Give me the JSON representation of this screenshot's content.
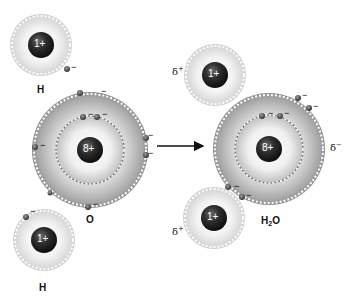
{
  "diagram": {
    "reaction_arrow": "→",
    "reactants": {
      "hydrogen_top": {
        "symbol": "H",
        "nucleus_charge": "1+",
        "electrons": 1
      },
      "oxygen": {
        "symbol": "O",
        "nucleus_charge": "8+",
        "inner_shell_electrons": 2,
        "outer_shell_electrons": 6
      },
      "hydrogen_bottom": {
        "symbol": "H",
        "nucleus_charge": "1+",
        "electrons": 1
      }
    },
    "product": {
      "formula_main": "H",
      "formula_sub": "2",
      "formula_tail": "O",
      "hydrogen_top": {
        "nucleus_charge": "1+",
        "partial_charge": "δ",
        "partial_sign": "+"
      },
      "oxygen": {
        "nucleus_charge": "8+",
        "partial_charge": "δ",
        "partial_sign": "−"
      },
      "hydrogen_bottom": {
        "nucleus_charge": "1+",
        "partial_charge": "δ",
        "partial_sign": "+"
      }
    },
    "electron_sign": "−",
    "colors": {
      "nucleus": "#2a2a2a",
      "shell_light": "#f2f2f2",
      "shell_dark": "#9a9a9a",
      "electron": "#555555",
      "text": "#111111"
    }
  }
}
